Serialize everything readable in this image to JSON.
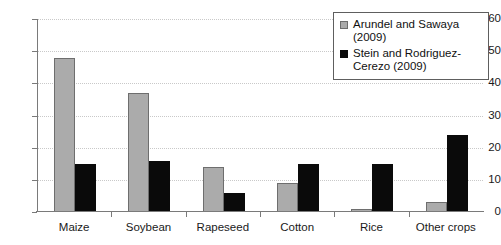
{
  "chart_data": {
    "type": "bar",
    "title": "",
    "xlabel": "",
    "ylabel": "",
    "categories": [
      "Maize",
      "Soybean",
      "Rapeseed",
      "Cotton",
      "Rice",
      "Other crops"
    ],
    "series": [
      {
        "name": "Arundel and Sawaya (2009)",
        "color": "#ababab",
        "values": [
          48,
          37,
          14,
          9,
          1,
          3
        ]
      },
      {
        "name": "Stein and Rodriguez-Cerezo (2009)",
        "color": "#0a0a0a",
        "values": [
          15,
          16,
          6,
          15,
          15,
          24
        ]
      }
    ],
    "ylim": [
      0,
      60
    ],
    "yticks": [
      0,
      10,
      20,
      30,
      40,
      50,
      60
    ],
    "ytick_labels": [
      "0",
      "10",
      "20",
      "30",
      "40",
      "50",
      "60"
    ],
    "grid": true,
    "grid_axis": "y",
    "legend_position": "top-right"
  },
  "legend": {
    "entries": [
      {
        "label": "Arundel and Sawaya (2009)"
      },
      {
        "label": "Stein and Rodriguez-Cerezo (2009)"
      }
    ]
  }
}
